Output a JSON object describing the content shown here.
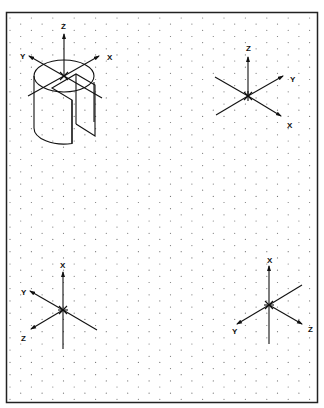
{
  "diagram": {
    "title": "",
    "type": "isometric UCS icons on isometric dot grid",
    "frame": {
      "x": 6,
      "y": 12,
      "width": 312,
      "height": 391,
      "stroke": "#222222"
    },
    "grid": {
      "dot_color": "#777777",
      "col_spacing": 10.7,
      "row_spacing": 12.3
    },
    "colors": {
      "line": "#111111",
      "background": "#ffffff"
    }
  },
  "icons": [
    {
      "id": "cylinder-ucs",
      "description": "Cylinder with slot cut, UCS axes at top center",
      "origin": [
        65,
        76
      ],
      "labels": {
        "z": "Z",
        "y": "Y",
        "x": "X"
      }
    },
    {
      "id": "ucs-top-right",
      "origin": [
        248,
        96
      ],
      "labels": {
        "z": "Z",
        "y": "Y",
        "x": "X"
      }
    },
    {
      "id": "ucs-bottom-left",
      "origin": [
        63,
        310
      ],
      "labels": {
        "x": "X",
        "y": "Y",
        "z": "Z"
      }
    },
    {
      "id": "ucs-bottom-right",
      "origin": [
        269,
        305
      ],
      "labels": {
        "x": "X",
        "y": "Y",
        "z": "Z"
      }
    }
  ]
}
